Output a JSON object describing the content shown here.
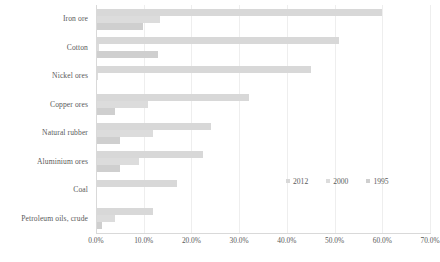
{
  "chart_data": {
    "type": "bar",
    "orientation": "horizontal",
    "title": "",
    "xlabel": "",
    "ylabel": "",
    "xlim": [
      0,
      70
    ],
    "xticks": [
      "0.0%",
      "10.0%",
      "20.0%",
      "30.0%",
      "40.0%",
      "50.0%",
      "60.0%",
      "70.0%"
    ],
    "xtick_values": [
      0,
      10,
      20,
      30,
      40,
      50,
      60,
      70
    ],
    "grid": true,
    "legend_position": "inside-right",
    "categories": [
      "Iron ore",
      "Cotton",
      "Nickel ores",
      "Copper ores",
      "Natural rubber",
      "Aluminium ores",
      "Coal",
      "Petroleum oils, crude"
    ],
    "series": [
      {
        "name": "2012",
        "color": "#d8d8d8",
        "values": [
          60.0,
          51.0,
          45.0,
          32.0,
          24.0,
          22.5,
          17.0,
          12.0
        ]
      },
      {
        "name": "2000",
        "color": "#dcdcdc",
        "values": [
          13.5,
          0.6,
          0.4,
          11.0,
          12.0,
          9.0,
          0.3,
          4.0
        ]
      },
      {
        "name": "1995",
        "color": "#cfcfcf",
        "values": [
          9.8,
          13.0,
          0.3,
          4.0,
          5.0,
          5.0,
          0.3,
          1.2
        ]
      }
    ]
  },
  "legend": {
    "items": [
      {
        "label": "2012"
      },
      {
        "label": "2000"
      },
      {
        "label": "1995"
      }
    ]
  }
}
